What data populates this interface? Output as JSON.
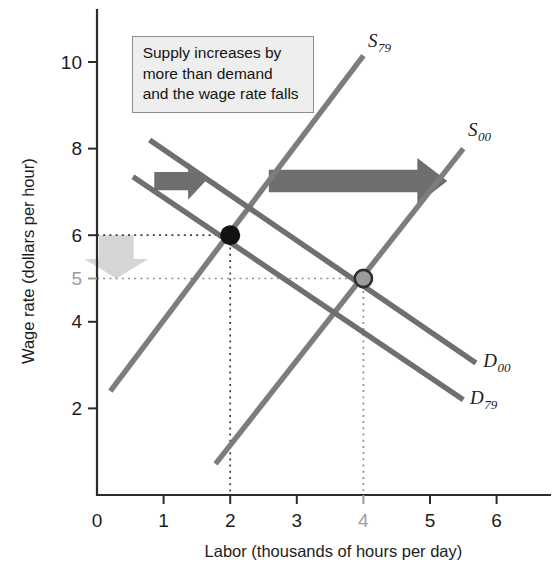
{
  "chart_data": {
    "type": "line",
    "title": "",
    "xlabel": "Labor (thousands of hours per day)",
    "ylabel": "Wage rate (dollars per hour)",
    "xlim": [
      0,
      6.8
    ],
    "ylim": [
      0,
      11.2
    ],
    "grid": false,
    "legend": "inline-curve-labels",
    "xticks": [
      {
        "value": 0,
        "label": "0",
        "muted": false
      },
      {
        "value": 1,
        "label": "1",
        "muted": false
      },
      {
        "value": 2,
        "label": "2",
        "muted": false
      },
      {
        "value": 3,
        "label": "3",
        "muted": false
      },
      {
        "value": 4,
        "label": "4",
        "muted": true
      },
      {
        "value": 5,
        "label": "5",
        "muted": false
      },
      {
        "value": 6,
        "label": "6",
        "muted": false
      }
    ],
    "yticks": [
      {
        "value": 2,
        "label": "2",
        "muted": false
      },
      {
        "value": 4,
        "label": "4",
        "muted": false
      },
      {
        "value": 5,
        "label": "5",
        "muted": true
      },
      {
        "value": 6,
        "label": "6",
        "muted": false
      },
      {
        "value": 8,
        "label": "8",
        "muted": false
      },
      {
        "value": 10,
        "label": "10",
        "muted": false
      }
    ],
    "series": [
      {
        "name": "S79",
        "label_main": "S",
        "label_sub": "79",
        "kind": "supply",
        "points": [
          [
            0.2,
            2.4
          ],
          [
            4.0,
            10.15
          ]
        ],
        "label_at": [
          4.07,
          10.35
        ]
      },
      {
        "name": "S00",
        "label_main": "S",
        "label_sub": "00",
        "kind": "supply",
        "points": [
          [
            1.78,
            0.72
          ],
          [
            5.5,
            8.0
          ]
        ],
        "label_at": [
          5.57,
          8.3
        ]
      },
      {
        "name": "D00",
        "label_main": "D",
        "label_sub": "00",
        "kind": "demand",
        "points": [
          [
            0.79,
            8.2
          ],
          [
            5.69,
            3.05
          ]
        ],
        "label_at": [
          5.8,
          2.95
        ]
      },
      {
        "name": "D79",
        "label_main": "D",
        "label_sub": "79",
        "kind": "demand",
        "points": [
          [
            0.54,
            7.35
          ],
          [
            5.5,
            2.2
          ]
        ],
        "label_at": [
          5.6,
          2.1
        ]
      }
    ],
    "equilibria": [
      {
        "name": "original-equilibrium",
        "x": 2,
        "y": 6,
        "style": "filled-black"
      },
      {
        "name": "new-equilibrium",
        "x": 4,
        "y": 5,
        "style": "gray-outlined"
      }
    ],
    "guides": [
      {
        "name": "wage-6-guide",
        "from": [
          0,
          6
        ],
        "to": [
          2,
          6
        ],
        "muted": false
      },
      {
        "name": "labor-2-guide",
        "from": [
          2,
          6
        ],
        "to": [
          2,
          0
        ],
        "muted": false
      },
      {
        "name": "wage-5-guide",
        "from": [
          0,
          5
        ],
        "to": [
          4,
          5
        ],
        "muted": true
      },
      {
        "name": "labor-4-guide",
        "from": [
          4,
          5
        ],
        "to": [
          4,
          0
        ],
        "muted": true
      }
    ],
    "annotations": [
      {
        "name": "demand-shift-arrow",
        "kind": "arrow-right",
        "from": [
          0.86,
          7.25
        ],
        "to": [
          1.63,
          7.25
        ],
        "thickness": 0.42
      },
      {
        "name": "supply-shift-arrow",
        "kind": "arrow-right",
        "from": [
          2.58,
          7.25
        ],
        "to": [
          5.26,
          7.25
        ],
        "thickness": 0.52
      },
      {
        "name": "wage-fall-arrow",
        "kind": "arrow-down",
        "from": [
          0.29,
          6.0
        ],
        "to": [
          0.29,
          5.0
        ],
        "thickness": 0.52
      }
    ]
  },
  "note": {
    "text": "Supply increases by\nmore than demand\nand the wage rate falls"
  },
  "colors": {
    "supply_curve": "#7d7d7d",
    "demand_curve": "#6f6f6f",
    "shift_arrow": "#6e6e6e",
    "drop_arrow": "#d5d5d5",
    "equilibrium_old": "#121212",
    "equilibrium_new": "#9b9b9b",
    "note_background": "#eeeeee",
    "axis": "#2b2b2b"
  }
}
